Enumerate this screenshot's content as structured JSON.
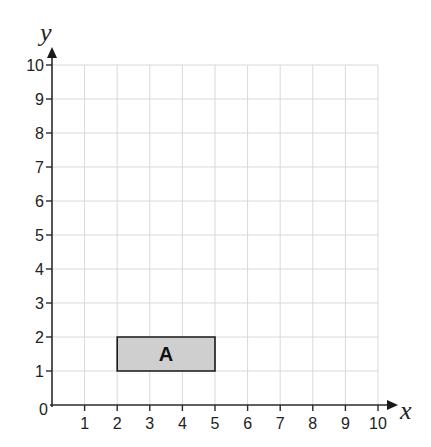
{
  "chart_data": {
    "type": "coordinate-grid",
    "title": "",
    "xlabel": "x",
    "ylabel": "y",
    "xlim": [
      0,
      10
    ],
    "ylim": [
      0,
      10
    ],
    "grid": true,
    "x_ticks": [
      "1",
      "2",
      "3",
      "4",
      "5",
      "6",
      "7",
      "8",
      "9",
      "10"
    ],
    "y_ticks": [
      "1",
      "2",
      "3",
      "4",
      "5",
      "6",
      "7",
      "8",
      "9",
      "10"
    ],
    "origin_label": "0",
    "shapes": [
      {
        "name": "A",
        "type": "rectangle",
        "vertices": [
          [
            2,
            1
          ],
          [
            5,
            1
          ],
          [
            5,
            2
          ],
          [
            2,
            2
          ]
        ],
        "fill": "#cfcfcf",
        "stroke": "#1a1a1a"
      }
    ]
  },
  "layout": {
    "origin_px": [
      52,
      405
    ],
    "unit_x_px": 32.6,
    "unit_y_px": 34.0
  }
}
